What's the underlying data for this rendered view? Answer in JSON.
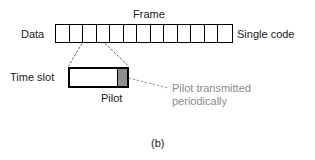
{
  "figure": {
    "subfigure_label": "(b)",
    "background_color": "#ffffff",
    "line_color": "#000000",
    "callout_color": "#8a8a8a",
    "pilot_fill_color": "#8e8e8e"
  },
  "labels": {
    "data": "Data",
    "frame": "Frame",
    "single_code": "Single code",
    "time_slot": "Time slot",
    "pilot": "Pilot"
  },
  "callout": {
    "line1": "Pilot transmitted",
    "line2": "periodically"
  },
  "frame": {
    "slot_count": 13,
    "slots": [
      1,
      2,
      3,
      4,
      5,
      6,
      7,
      8,
      9,
      10,
      11,
      12,
      13
    ]
  },
  "time_slot": {
    "segments": [
      {
        "name": "data",
        "fill": "white"
      },
      {
        "name": "pilot",
        "fill": "gray"
      }
    ]
  }
}
